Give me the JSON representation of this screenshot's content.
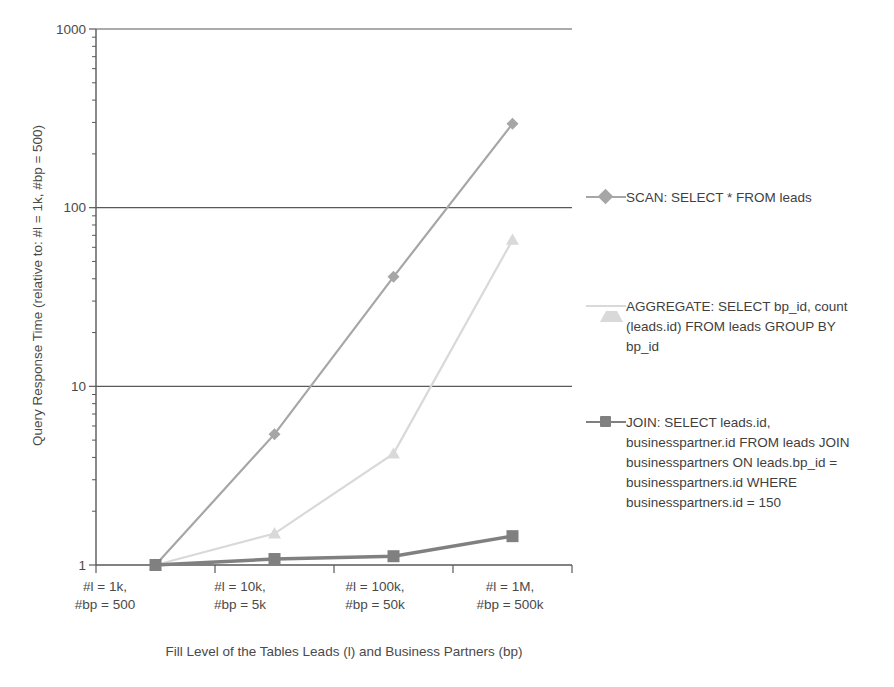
{
  "chart_data": {
    "type": "line",
    "title": "",
    "xlabel": "Fill Level of the Tables Leads (l) and Business Partners (bp)",
    "ylabel": "Query Response Time (relative to: #l = 1k, #bp = 500)",
    "yscale": "log",
    "ylim": [
      1,
      1000
    ],
    "yticks": [
      "1",
      "10",
      "100",
      "1000"
    ],
    "ytick_values": [
      1,
      10,
      100,
      1000
    ],
    "grid": true,
    "legend_position": "right",
    "categories": [
      "#l = 1k,\n#bp = 500",
      "#l = 10k,\n#bp = 5k",
      "#l = 100k,\n#bp = 50k",
      "#l = 1M,\n#bp = 500k"
    ],
    "categories_lines": [
      [
        "#l = 1k,",
        "#bp = 500"
      ],
      [
        "#l = 10k,",
        "#bp = 5k"
      ],
      [
        "#l = 100k,",
        "#bp = 50k"
      ],
      [
        "#l = 1M,",
        "#bp = 500k"
      ]
    ],
    "series": [
      {
        "name": "SCAN: SELECT * FROM leads",
        "marker": "diamond",
        "color": "#a6a6a6",
        "values": [
          1,
          5.4,
          41,
          295
        ]
      },
      {
        "name": "AGGREGATE: SELECT bp_id, count (leads.id) FROM leads GROUP BY bp_id",
        "marker": "triangle",
        "color": "#d9d9d9",
        "values": [
          1,
          1.5,
          4.2,
          66
        ]
      },
      {
        "name": "JOIN: SELECT leads.id, businesspartner.id FROM leads JOIN businesspartners ON leads.bp_id = businesspartners.id WHERE businesspartners.id = 150",
        "marker": "square",
        "color": "#808080",
        "values": [
          1,
          1.08,
          1.12,
          1.45
        ]
      }
    ]
  },
  "legend": {
    "entries": [
      {
        "label": "SCAN: SELECT * FROM leads",
        "lines": [
          "SCAN: SELECT * FROM leads"
        ],
        "color": "#a6a6a6",
        "marker": "diamond-marker"
      },
      {
        "label": "AGGREGATE: SELECT bp_id, count (leads.id) FROM leads GROUP BY bp_id",
        "lines": [
          "AGGREGATE: SELECT bp_id, count",
          "(leads.id) FROM leads GROUP BY",
          "bp_id"
        ],
        "color": "#d9d9d9",
        "marker": "triangle-marker"
      },
      {
        "label": "JOIN: SELECT leads.id, businesspartner.id FROM leads JOIN businesspartners ON leads.bp_id = businesspartners.id WHERE businesspartners.id = 150",
        "lines": [
          "JOIN: SELECT leads.id,",
          "businesspartner.id FROM leads JOIN",
          "businesspartners ON leads.bp_id =",
          "businesspartners.id WHERE",
          "businesspartners.id = 150"
        ],
        "color": "#808080",
        "marker": "square-marker"
      }
    ]
  },
  "axes": {
    "y_title": "Query Response Time (relative to: #l = 1k, #bp = 500)",
    "x_title": "Fill Level of the Tables Leads (l) and Business Partners (bp)",
    "y_tick_labels": [
      "1000",
      "100",
      "10",
      "1"
    ],
    "x_tick_labels_l1": [
      "#l = 1k,",
      "#l = 10k,",
      "#l = 100k,",
      "#l = 1M,"
    ],
    "x_tick_labels_l2": [
      "#bp = 500",
      "#bp = 5k",
      "#bp = 50k",
      "#bp = 500k"
    ]
  },
  "colors": {
    "axis": "#595959",
    "grid": "#595959",
    "text": "#4a4a4a",
    "scan": "#a6a6a6",
    "aggregate": "#d9d9d9",
    "join": "#808080"
  }
}
